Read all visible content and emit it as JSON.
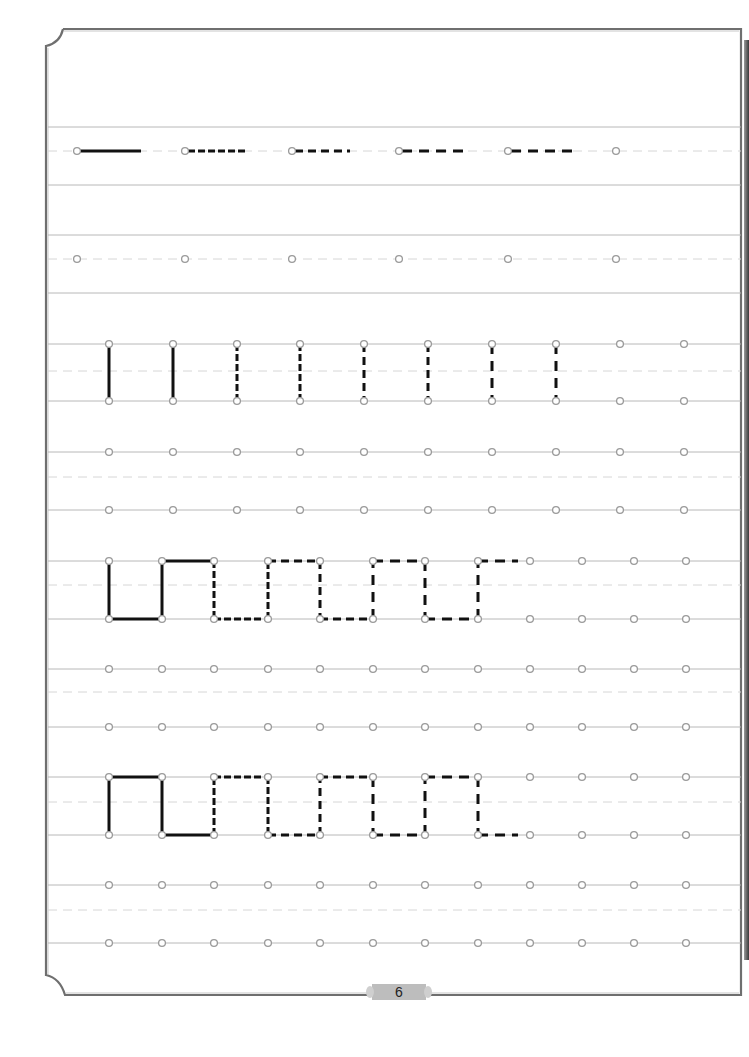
{
  "page": {
    "number": "6",
    "colors": {
      "border": "#6f6f6f",
      "guide_line": "#b8b8b8",
      "dashed_guide": "#d6d6d6",
      "dot_stroke": "#9a9a9a",
      "stroke": "#111111",
      "page_tab": "#bdbdbd"
    }
  },
  "exercises": [
    {
      "name": "horizontal-strokes",
      "rows": [
        {
          "top": 127,
          "mid": 151,
          "bottom": 185,
          "dots": [
            {
              "x": 77,
              "y": 151
            },
            {
              "x": 185,
              "y": 151
            },
            {
              "x": 292,
              "y": 151
            },
            {
              "x": 399,
              "y": 151
            },
            {
              "x": 508,
              "y": 151
            },
            {
              "x": 616,
              "y": 151
            }
          ],
          "strokes": [
            {
              "x1": 80,
              "y1": 151,
              "x2": 141,
              "y2": 151,
              "style": "solid"
            },
            {
              "x1": 188,
              "y1": 151,
              "x2": 246,
              "y2": 151,
              "style": "dash-short"
            },
            {
              "x1": 295,
              "y1": 151,
              "x2": 350,
              "y2": 151,
              "style": "dash"
            },
            {
              "x1": 402,
              "y1": 151,
              "x2": 464,
              "y2": 151,
              "style": "dash-long"
            },
            {
              "x1": 511,
              "y1": 151,
              "x2": 572,
              "y2": 151,
              "style": "dash-long"
            }
          ]
        },
        {
          "top": 235,
          "mid": 259,
          "bottom": 293,
          "dots": [
            {
              "x": 77,
              "y": 259
            },
            {
              "x": 185,
              "y": 259
            },
            {
              "x": 292,
              "y": 259
            },
            {
              "x": 399,
              "y": 259
            },
            {
              "x": 508,
              "y": 259
            },
            {
              "x": 616,
              "y": 259
            }
          ],
          "strokes": []
        }
      ]
    },
    {
      "name": "vertical-strokes",
      "rows": [
        {
          "top": 344,
          "mid": 371,
          "bottom": 401,
          "dots_x": [
            109,
            173,
            237,
            300,
            364,
            428,
            492,
            556,
            620,
            684
          ],
          "strokes": [
            {
              "x1": 109,
              "y1": 344,
              "x2": 109,
              "y2": 401,
              "style": "solid"
            },
            {
              "x1": 173,
              "y1": 344,
              "x2": 173,
              "y2": 401,
              "style": "solid"
            },
            {
              "x1": 237,
              "y1": 344,
              "x2": 237,
              "y2": 401,
              "style": "dash-short"
            },
            {
              "x1": 300,
              "y1": 344,
              "x2": 300,
              "y2": 401,
              "style": "dash-short"
            },
            {
              "x1": 364,
              "y1": 344,
              "x2": 364,
              "y2": 401,
              "style": "dash"
            },
            {
              "x1": 428,
              "y1": 344,
              "x2": 428,
              "y2": 401,
              "style": "dash"
            },
            {
              "x1": 492,
              "y1": 344,
              "x2": 492,
              "y2": 401,
              "style": "dash-long"
            },
            {
              "x1": 556,
              "y1": 344,
              "x2": 556,
              "y2": 401,
              "style": "dash-long"
            }
          ]
        },
        {
          "top": 452,
          "mid": 477,
          "bottom": 510,
          "dots_x": [
            109,
            173,
            237,
            300,
            364,
            428,
            492,
            556,
            620,
            684
          ],
          "strokes": []
        }
      ]
    },
    {
      "name": "square-wave-u",
      "rows": [
        {
          "top": 561,
          "mid": 585,
          "bottom": 619,
          "dots_x": [
            109,
            162,
            214,
            268,
            320,
            373,
            425,
            478,
            530,
            582,
            634,
            686
          ],
          "strokes": [
            {
              "x1": 109,
              "y1": 561,
              "x2": 109,
              "y2": 619,
              "style": "solid"
            },
            {
              "x1": 109,
              "y1": 619,
              "x2": 162,
              "y2": 619,
              "style": "solid"
            },
            {
              "x1": 162,
              "y1": 619,
              "x2": 162,
              "y2": 561,
              "style": "solid"
            },
            {
              "x1": 162,
              "y1": 561,
              "x2": 214,
              "y2": 561,
              "style": "solid"
            },
            {
              "x1": 214,
              "y1": 561,
              "x2": 214,
              "y2": 619,
              "style": "dash-short"
            },
            {
              "x1": 214,
              "y1": 619,
              "x2": 268,
              "y2": 619,
              "style": "dash-short"
            },
            {
              "x1": 268,
              "y1": 619,
              "x2": 268,
              "y2": 561,
              "style": "dash-short"
            },
            {
              "x1": 268,
              "y1": 561,
              "x2": 320,
              "y2": 561,
              "style": "dash"
            },
            {
              "x1": 320,
              "y1": 561,
              "x2": 320,
              "y2": 619,
              "style": "dash"
            },
            {
              "x1": 320,
              "y1": 619,
              "x2": 373,
              "y2": 619,
              "style": "dash"
            },
            {
              "x1": 373,
              "y1": 619,
              "x2": 373,
              "y2": 561,
              "style": "dash-long"
            },
            {
              "x1": 373,
              "y1": 561,
              "x2": 425,
              "y2": 561,
              "style": "dash-long"
            },
            {
              "x1": 425,
              "y1": 561,
              "x2": 425,
              "y2": 619,
              "style": "dash-long"
            },
            {
              "x1": 425,
              "y1": 619,
              "x2": 478,
              "y2": 619,
              "style": "dash-long"
            },
            {
              "x1": 478,
              "y1": 619,
              "x2": 478,
              "y2": 561,
              "style": "dash-long"
            },
            {
              "x1": 478,
              "y1": 561,
              "x2": 518,
              "y2": 561,
              "style": "dash-long"
            }
          ]
        },
        {
          "top": 669,
          "mid": 692,
          "bottom": 727,
          "dots_x": [
            109,
            162,
            214,
            268,
            320,
            373,
            425,
            478,
            530,
            582,
            634,
            686
          ],
          "strokes": []
        }
      ]
    },
    {
      "name": "square-wave-n",
      "rows": [
        {
          "top": 777,
          "mid": 802,
          "bottom": 835,
          "dots_x": [
            109,
            162,
            214,
            268,
            320,
            373,
            425,
            478,
            530,
            582,
            634,
            686
          ],
          "strokes": [
            {
              "x1": 109,
              "y1": 835,
              "x2": 109,
              "y2": 777,
              "style": "solid"
            },
            {
              "x1": 109,
              "y1": 777,
              "x2": 162,
              "y2": 777,
              "style": "solid"
            },
            {
              "x1": 162,
              "y1": 777,
              "x2": 162,
              "y2": 835,
              "style": "solid"
            },
            {
              "x1": 162,
              "y1": 835,
              "x2": 214,
              "y2": 835,
              "style": "solid"
            },
            {
              "x1": 214,
              "y1": 835,
              "x2": 214,
              "y2": 777,
              "style": "dash-short"
            },
            {
              "x1": 214,
              "y1": 777,
              "x2": 268,
              "y2": 777,
              "style": "dash-short"
            },
            {
              "x1": 268,
              "y1": 777,
              "x2": 268,
              "y2": 835,
              "style": "dash-short"
            },
            {
              "x1": 268,
              "y1": 835,
              "x2": 320,
              "y2": 835,
              "style": "dash"
            },
            {
              "x1": 320,
              "y1": 835,
              "x2": 320,
              "y2": 777,
              "style": "dash"
            },
            {
              "x1": 320,
              "y1": 777,
              "x2": 373,
              "y2": 777,
              "style": "dash"
            },
            {
              "x1": 373,
              "y1": 777,
              "x2": 373,
              "y2": 835,
              "style": "dash-long"
            },
            {
              "x1": 373,
              "y1": 835,
              "x2": 425,
              "y2": 835,
              "style": "dash-long"
            },
            {
              "x1": 425,
              "y1": 835,
              "x2": 425,
              "y2": 777,
              "style": "dash-long"
            },
            {
              "x1": 425,
              "y1": 777,
              "x2": 478,
              "y2": 777,
              "style": "dash-long"
            },
            {
              "x1": 478,
              "y1": 777,
              "x2": 478,
              "y2": 835,
              "style": "dash-long"
            },
            {
              "x1": 478,
              "y1": 835,
              "x2": 518,
              "y2": 835,
              "style": "dash-long"
            }
          ]
        },
        {
          "top": 885,
          "mid": 910,
          "bottom": 943,
          "dots_x": [
            109,
            162,
            214,
            268,
            320,
            373,
            425,
            478,
            530,
            582,
            634,
            686
          ],
          "strokes": []
        }
      ]
    }
  ]
}
